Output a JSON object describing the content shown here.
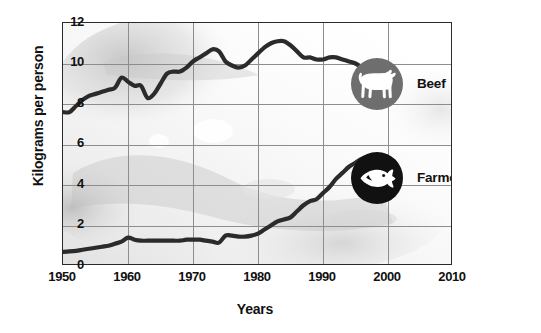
{
  "chart_data": {
    "type": "line",
    "title": "",
    "xlabel": "Years",
    "ylabel": "Kilograms per person",
    "xlim": [
      1950,
      2010
    ],
    "ylim": [
      0,
      12
    ],
    "xticks": [
      "1950",
      "1960",
      "1970",
      "1980",
      "1990",
      "2000",
      "2010"
    ],
    "yticks": [
      "0",
      "2",
      "4",
      "6",
      "8",
      "10",
      "12"
    ],
    "grid": true,
    "legend_position": "inside-right",
    "series": [
      {
        "name": "Beef",
        "color": "#2b2b2b",
        "marker_color": "#6e6e6e",
        "icon": "cow-icon",
        "x": [
          1950,
          1951,
          1952,
          1953,
          1954,
          1955,
          1956,
          1957,
          1958,
          1959,
          1960,
          1961,
          1962,
          1963,
          1964,
          1965,
          1966,
          1967,
          1968,
          1969,
          1970,
          1971,
          1972,
          1973,
          1974,
          1975,
          1976,
          1977,
          1978,
          1979,
          1980,
          1981,
          1982,
          1983,
          1984,
          1985,
          1986,
          1987,
          1988,
          1989,
          1990,
          1991,
          1992,
          1993,
          1994,
          1995,
          1996,
          1997,
          1998
        ],
        "values": [
          7.6,
          7.6,
          7.9,
          8.2,
          8.4,
          8.5,
          8.6,
          8.7,
          8.8,
          9.3,
          9.1,
          8.9,
          8.9,
          8.3,
          8.5,
          9.0,
          9.5,
          9.6,
          9.6,
          9.8,
          10.1,
          10.3,
          10.5,
          10.7,
          10.6,
          10.1,
          9.9,
          9.8,
          9.9,
          10.2,
          10.5,
          10.8,
          11.0,
          11.1,
          11.1,
          10.9,
          10.6,
          10.3,
          10.3,
          10.2,
          10.2,
          10.3,
          10.3,
          10.2,
          10.1,
          10.0,
          9.8,
          9.5,
          9.3
        ]
      },
      {
        "name": "Farmed fish",
        "color": "#2b2b2b",
        "marker_color": "#111111",
        "icon": "fish-icon",
        "x": [
          1950,
          1951,
          1952,
          1953,
          1954,
          1955,
          1956,
          1957,
          1958,
          1959,
          1960,
          1961,
          1962,
          1963,
          1964,
          1965,
          1966,
          1967,
          1968,
          1969,
          1970,
          1971,
          1972,
          1973,
          1974,
          1975,
          1976,
          1977,
          1978,
          1979,
          1980,
          1981,
          1982,
          1983,
          1984,
          1985,
          1986,
          1987,
          1988,
          1989,
          1990,
          1991,
          1992,
          1993,
          1994,
          1995,
          1996,
          1997,
          1998
        ],
        "values": [
          0.7,
          0.72,
          0.75,
          0.8,
          0.85,
          0.9,
          0.95,
          1.0,
          1.1,
          1.2,
          1.4,
          1.3,
          1.25,
          1.25,
          1.25,
          1.25,
          1.25,
          1.25,
          1.25,
          1.3,
          1.3,
          1.3,
          1.25,
          1.2,
          1.15,
          1.5,
          1.5,
          1.45,
          1.45,
          1.5,
          1.6,
          1.8,
          2.0,
          2.2,
          2.3,
          2.4,
          2.7,
          3.0,
          3.2,
          3.3,
          3.6,
          3.9,
          4.3,
          4.6,
          4.9,
          5.1,
          5.3,
          5.4,
          5.4
        ]
      }
    ]
  },
  "legend": {
    "beef": {
      "label": "Beef",
      "icon": "cow-icon",
      "disc_color": "#6e6e6e"
    },
    "fish": {
      "label": "Farmed fish",
      "icon": "fish-icon",
      "disc_color": "#111111"
    }
  },
  "axes": {
    "y_title": "Kilograms per person",
    "x_title": "Years",
    "y_ticks": [
      "12",
      "10",
      "8",
      "6",
      "4",
      "2",
      "0"
    ],
    "x_ticks": [
      "1950",
      "1960",
      "1970",
      "1980",
      "1990",
      "2000",
      "2010"
    ]
  }
}
